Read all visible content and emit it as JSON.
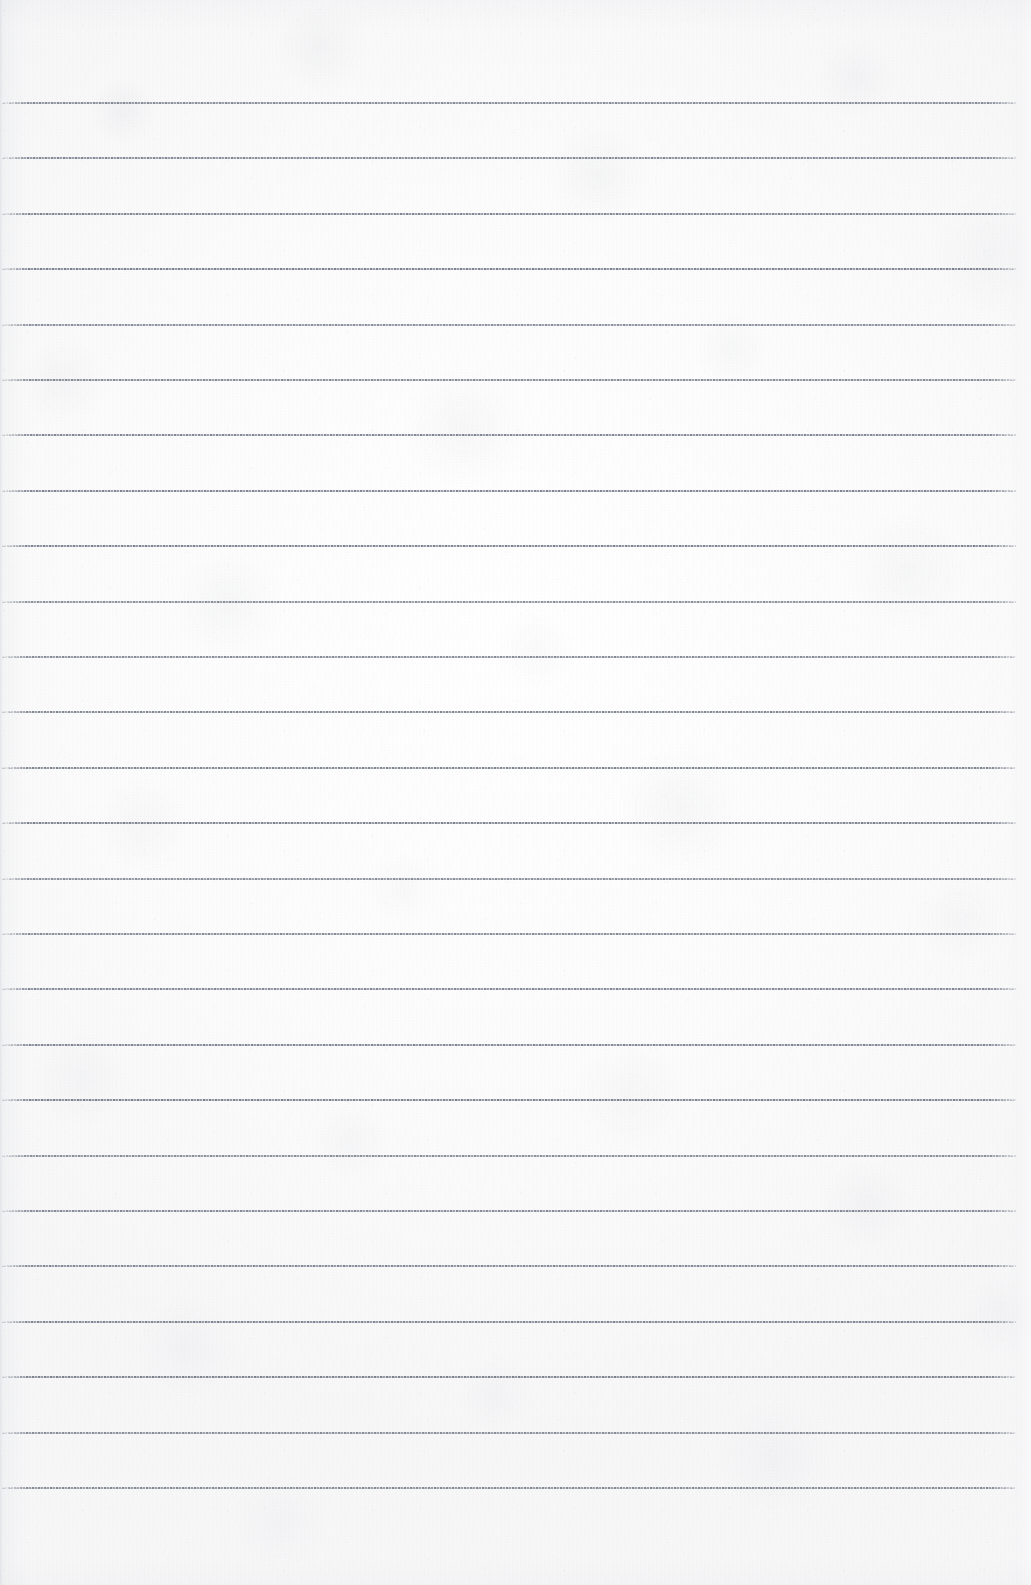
{
  "document": {
    "kind": "scanned-lined-paper",
    "title": "Blank ruled notebook page",
    "page_width": 1031,
    "page_height": 1585,
    "paper_color": "#fbfbfb",
    "paper_tint": "#f7f7f8",
    "rule_color": "#6e7480",
    "rule_color_light": "#969ca8",
    "content_text": "",
    "ruling": {
      "style": "horizontal ruled lines, no margin rule",
      "line_count": 26,
      "first_line_y": 103,
      "line_spacing": 55.4,
      "line_thickness": 2,
      "line_start_x": 2,
      "line_end_x": 1016,
      "top_margin": 103,
      "bottom_margin": 98
    },
    "lines": [
      {
        "index": 1,
        "y": 103
      },
      {
        "index": 2,
        "y": 158
      },
      {
        "index": 3,
        "y": 214
      },
      {
        "index": 4,
        "y": 269
      },
      {
        "index": 5,
        "y": 325
      },
      {
        "index": 6,
        "y": 380
      },
      {
        "index": 7,
        "y": 435
      },
      {
        "index": 8,
        "y": 491
      },
      {
        "index": 9,
        "y": 546
      },
      {
        "index": 10,
        "y": 602
      },
      {
        "index": 11,
        "y": 657
      },
      {
        "index": 12,
        "y": 712
      },
      {
        "index": 13,
        "y": 768
      },
      {
        "index": 14,
        "y": 823
      },
      {
        "index": 15,
        "y": 879
      },
      {
        "index": 16,
        "y": 934
      },
      {
        "index": 17,
        "y": 989
      },
      {
        "index": 18,
        "y": 1045
      },
      {
        "index": 19,
        "y": 1100
      },
      {
        "index": 20,
        "y": 1156
      },
      {
        "index": 21,
        "y": 1211
      },
      {
        "index": 22,
        "y": 1266
      },
      {
        "index": 23,
        "y": 1322
      },
      {
        "index": 24,
        "y": 1377
      },
      {
        "index": 25,
        "y": 1433
      },
      {
        "index": 26,
        "y": 1488
      }
    ]
  }
}
